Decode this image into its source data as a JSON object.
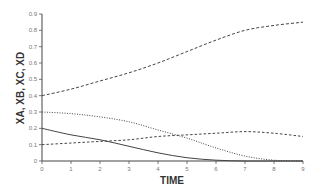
{
  "chart_data": {
    "type": "line",
    "title": "",
    "xlabel": "TIME",
    "ylabel": "XA, XB, XC, XD",
    "xlim": [
      0,
      9
    ],
    "ylim": [
      0,
      0.9
    ],
    "xticks": [
      "0",
      "1",
      "2",
      "3",
      "4",
      "5",
      "6",
      "7",
      "8",
      "9"
    ],
    "yticks": [
      "0",
      "0.1",
      "0.2",
      "0.3",
      "0.4",
      "0.5",
      "0.6",
      "0.7",
      "0.8",
      "0.9"
    ],
    "grid": false,
    "legend": "none",
    "x": [
      0,
      1,
      2,
      3,
      4,
      5,
      6,
      7,
      8,
      9
    ],
    "series": [
      {
        "name": "XA",
        "style": "dashed",
        "values": [
          0.4,
          0.44,
          0.49,
          0.54,
          0.6,
          0.67,
          0.74,
          0.8,
          0.83,
          0.85
        ]
      },
      {
        "name": "XB",
        "style": "dotted",
        "values": [
          0.3,
          0.29,
          0.27,
          0.24,
          0.19,
          0.14,
          0.08,
          0.03,
          0.005,
          0.0
        ]
      },
      {
        "name": "XC",
        "style": "dash-short",
        "values": [
          0.1,
          0.11,
          0.12,
          0.13,
          0.15,
          0.16,
          0.17,
          0.18,
          0.17,
          0.15
        ]
      },
      {
        "name": "XD",
        "style": "solid",
        "values": [
          0.2,
          0.16,
          0.13,
          0.09,
          0.05,
          0.02,
          0.005,
          0.0,
          0.0,
          0.0
        ]
      }
    ]
  }
}
